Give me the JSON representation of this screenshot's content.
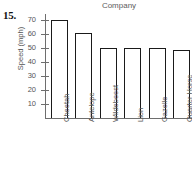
{
  "problem": {
    "number": "15."
  },
  "chart_data": {
    "type": "bar",
    "title": "Company",
    "xlabel": "",
    "ylabel": "Speed (mph)",
    "categories": [
      "Cheetah",
      "Antelope",
      "Wildebeest",
      "Lion",
      "Gazelle",
      "Quarter Horse"
    ],
    "values": [
      70,
      61,
      50,
      50,
      50,
      48.5
    ],
    "ylim": [
      0,
      75
    ],
    "yticks": [
      10,
      20,
      30,
      40,
      50,
      60,
      70
    ],
    "ytick_labels": [
      "10",
      "20",
      "30",
      "40",
      "50",
      "60",
      "70"
    ],
    "grid": false,
    "legend": null,
    "bar_fill_color": "#ffffff",
    "bar_edge_color": "#1a1a1a",
    "axis_color": "#6e6e6e",
    "text_color": "#555555",
    "background_color": "#ffffff"
  }
}
